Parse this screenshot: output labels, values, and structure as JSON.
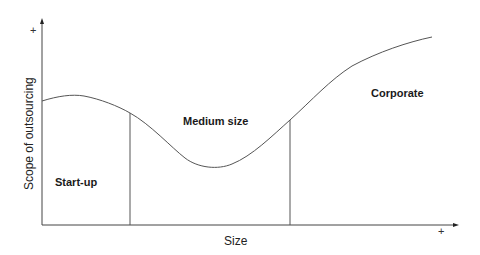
{
  "diagram": {
    "x_axis": {
      "label": "Size",
      "end_marker": "+"
    },
    "y_axis": {
      "label": "Scope of outsourcing",
      "end_marker": "+"
    },
    "regions": [
      {
        "label": "Start-up"
      },
      {
        "label": "Medium size"
      },
      {
        "label": "Corporate"
      }
    ],
    "colors": {
      "line": "#555555",
      "text": "#1a1a1a"
    }
  }
}
